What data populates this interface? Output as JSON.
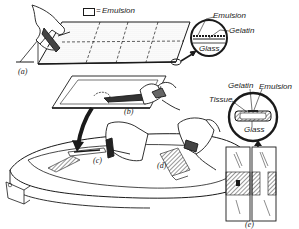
{
  "legend": {
    "symbol": "=",
    "label": "Emulsion"
  },
  "panels": {
    "a": "(a)",
    "b": "(b)",
    "c": "(c)",
    "d": "(d)",
    "e": "(e)"
  },
  "inset_top": {
    "labels": [
      "Emulsion",
      "Gelatin",
      "Glass"
    ]
  },
  "inset_bottom": {
    "labels": [
      "Gelatin",
      "Emulsion",
      "Tissue",
      "Glass"
    ]
  },
  "colors": {
    "ink": "#1a1a1a",
    "paper": "#ffffff",
    "emulsion_fill": "#e8e8e8"
  }
}
